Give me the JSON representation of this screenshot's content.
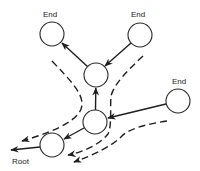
{
  "diagram": {
    "type": "tree-traversal",
    "labels": {
      "end_top_left": "End",
      "end_top_right": "End",
      "end_right": "End",
      "root": "Root"
    },
    "nodes": [
      {
        "id": "end-top-left",
        "label": "End",
        "cx": 52,
        "cy": 34
      },
      {
        "id": "end-top-right",
        "label": "End",
        "cx": 140,
        "cy": 35
      },
      {
        "id": "mid-upper",
        "label": "",
        "cx": 96,
        "cy": 75
      },
      {
        "id": "mid-lower",
        "label": "",
        "cx": 95,
        "cy": 122
      },
      {
        "id": "lower-left",
        "label": "",
        "cx": 52,
        "cy": 145
      },
      {
        "id": "end-right",
        "label": "End",
        "cx": 178,
        "cy": 101
      }
    ],
    "edges": [
      {
        "from": "mid-upper",
        "to": "end-top-left",
        "style": "solid-arrow"
      },
      {
        "from": "end-top-right",
        "to": "mid-upper",
        "style": "solid-arrow"
      },
      {
        "from": "mid-lower",
        "to": "mid-upper",
        "style": "solid-arrow"
      },
      {
        "from": "end-right",
        "to": "mid-lower",
        "style": "solid-arrow"
      },
      {
        "from": "mid-lower",
        "to": "lower-left",
        "style": "solid-arrow"
      },
      {
        "from": "lower-left",
        "to": "root",
        "style": "solid-arrow"
      }
    ],
    "dashed_paths": [
      "left-of-tree toward root",
      "between end-top-right branch and mid-lower",
      "two parallel paths from end-right toward lower-left"
    ],
    "colors": {
      "stroke": "#1e1e1e",
      "background": "#ffffff"
    }
  }
}
